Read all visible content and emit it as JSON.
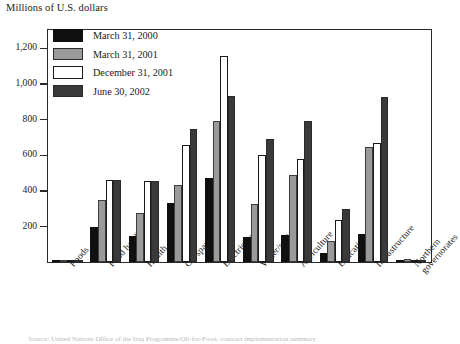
{
  "chart_data": {
    "type": "bar",
    "title": "Millions of U.S. dollars",
    "xlabel": "",
    "ylabel": "",
    "ylim": [
      0,
      1300
    ],
    "yticks": [
      0,
      200,
      400,
      600,
      800,
      1000,
      1200
    ],
    "ytick_labels": [
      "",
      "200",
      "400",
      "600",
      "800",
      "1,000",
      "1,200"
    ],
    "grid": false,
    "legend_position": "top-left",
    "categories": [
      "Foods",
      "Food handling",
      "Health",
      "Oil spares",
      "Electricity",
      "Water/sanitation",
      "Agriculture",
      "Education",
      "Infrastructure",
      "Northern governorates"
    ],
    "series": [
      {
        "name": "March 31, 2000",
        "color": "#101010",
        "values": [
          8,
          200,
          150,
          335,
          475,
          140,
          155,
          55,
          160,
          0
        ]
      },
      {
        "name": "March 31, 2001",
        "color": "#9a9a9a",
        "values": [
          8,
          350,
          275,
          435,
          790,
          330,
          490,
          120,
          645,
          20
        ]
      },
      {
        "name": "December 31, 2001",
        "color": "#ffffff",
        "values": [
          8,
          460,
          455,
          660,
          1155,
          600,
          580,
          235,
          670,
          8
        ]
      },
      {
        "name": "June 30, 2002",
        "color": "#3a3a3a",
        "values": [
          8,
          460,
          455,
          745,
          935,
          690,
          790,
          300,
          925,
          8
        ]
      }
    ]
  },
  "footnote": "Source: United Nations Office of the Iraq Programme/Oil-for-Food, contract implementation summary"
}
